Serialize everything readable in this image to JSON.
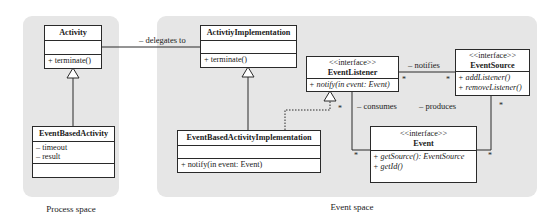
{
  "regions": {
    "process_space": {
      "label": "Process space"
    },
    "event_space": {
      "label": "Event space"
    }
  },
  "classes": {
    "activity": {
      "name": "Activity",
      "attributes": [],
      "operations": [
        "+ terminate()"
      ]
    },
    "event_based_activity": {
      "name": "EventBasedActivity",
      "attributes": [
        "– timeout",
        "– result"
      ],
      "operations": []
    },
    "activity_implementation": {
      "name": "ActivtiyImplementation",
      "attributes": [],
      "operations": [
        "+ terminate()"
      ]
    },
    "event_based_activity_implementation": {
      "name": "EventBasedActivityImplementation",
      "attributes": [],
      "operations": [
        "+ notify(in event: Event)"
      ]
    },
    "event_listener": {
      "stereotype": "<<interface>>",
      "name": "EventListener",
      "operations": [
        "+ notify(in event: Event)"
      ]
    },
    "event_source": {
      "stereotype": "<<interface>>",
      "name": "EventSource",
      "operations": [
        "+ addListener()",
        "+ removeListener()"
      ]
    },
    "event": {
      "stereotype": "<<interface>>",
      "name": "Event",
      "operations": [
        "+ getSource(): EventSource",
        "+ getId()"
      ]
    }
  },
  "associations": {
    "delegates_to": {
      "label": "– delegates to"
    },
    "notifies": {
      "label": "– notifies",
      "mult_source": "*",
      "mult_target": "*"
    },
    "consumes": {
      "label": "– consumes",
      "mult_source": "*",
      "mult_target": "*"
    },
    "produces": {
      "label": "– produces",
      "mult_source": "*",
      "mult_target": "*"
    },
    "realization_mult": "*"
  },
  "colors": {
    "region_fill": "#e6e6e6",
    "box_fill": "#ffffff",
    "line": "#2a2a2a"
  }
}
